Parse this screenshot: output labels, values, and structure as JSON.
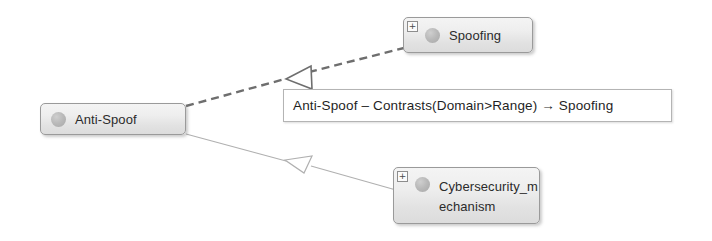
{
  "diagram": {
    "type": "uml-ontology-relation-diagram",
    "background_color": "#ffffff",
    "nodes": [
      {
        "id": "anti-spoof",
        "label": "Anti-Spoof",
        "has_expander": false,
        "expander_symbol": "",
        "icon": "entity-circle-icon"
      },
      {
        "id": "spoofing",
        "label": "Spoofing",
        "has_expander": true,
        "expander_symbol": "+",
        "icon": "entity-circle-icon"
      },
      {
        "id": "cybersecurity-mechanism",
        "label": "Cybersecurity_m\nechanism",
        "label_plain": "Cybersecurity_mechanism",
        "has_expander": true,
        "expander_symbol": "+",
        "icon": "entity-circle-icon"
      }
    ],
    "relation_label": {
      "text": "Anti-Spoof – Contrasts(Domain>Range) → Spoofing",
      "source": "Anti-Spoof",
      "relation": "Contrasts(Domain>Range)",
      "target": "Spoofing",
      "border_color": "#b4b4b4",
      "background_color": "#ffffff"
    },
    "connectors": [
      {
        "id": "anti-spoof-to-spoofing",
        "from": "anti-spoof",
        "to": "spoofing",
        "style": "dashed",
        "arrowhead": "hollow-triangle",
        "arrow_points_to": "anti-spoof",
        "color": "#6e6e6e"
      },
      {
        "id": "cybersecurity-mechanism-to-anti-spoof",
        "from": "cybersecurity-mechanism",
        "to": "anti-spoof",
        "style": "solid",
        "arrowhead": "hollow-triangle",
        "arrow_points_to": "anti-spoof",
        "color": "#b0b0b0"
      }
    ],
    "node_style": {
      "border_color": "#9a9a9a",
      "fill_top": "#f4f4f4",
      "fill_bottom": "#dcdcdc",
      "text_color": "#2b2b2b"
    }
  }
}
